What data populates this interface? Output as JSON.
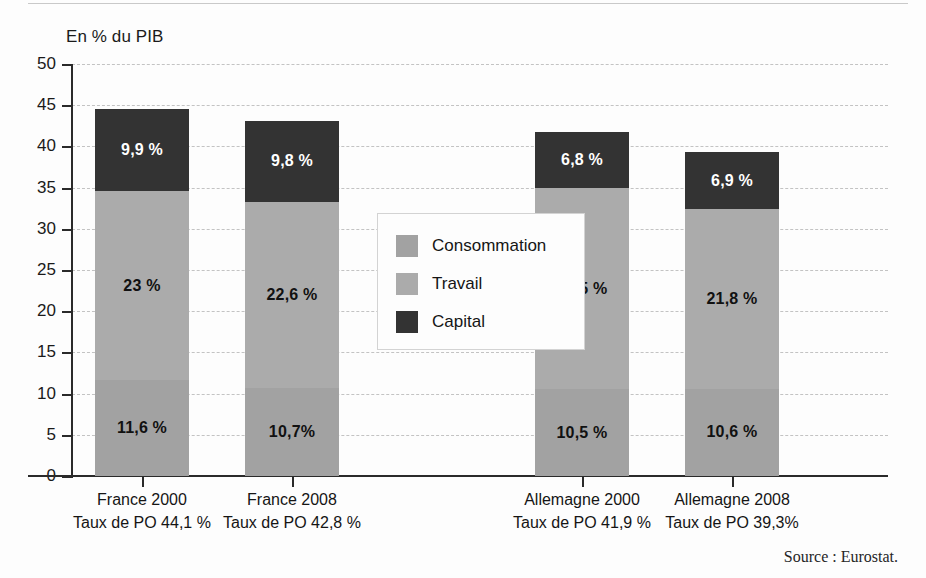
{
  "figure": {
    "axis_title": "En % du PIB",
    "source": "Source : Eurostat."
  },
  "legend": {
    "items": [
      {
        "label": "Consommation",
        "color": "#a2a2a2",
        "key": "consommation"
      },
      {
        "label": "Travail",
        "color": "#ababab",
        "key": "travail"
      },
      {
        "label": "Capital",
        "color": "#333333",
        "key": "capital"
      }
    ]
  },
  "y_axis": {
    "ticks": [
      "0",
      "5",
      "10",
      "15",
      "20",
      "25",
      "30",
      "35",
      "40",
      "45",
      "50"
    ]
  },
  "categories": [
    {
      "line1": "France 2000",
      "line2": "Taux de PO 44,1 %"
    },
    {
      "line1": "France 2008",
      "line2": "Taux de PO 42,8 %"
    },
    {
      "line1": "Allemagne 2000",
      "line2": "Taux de PO 41,9 %"
    },
    {
      "line1": "Allemagne 2008",
      "line2": "Taux de PO 39,3%"
    }
  ],
  "bar_labels": [
    {
      "consommation": "11,6 %",
      "travail": "23 %",
      "capital": "9,9 %"
    },
    {
      "consommation": "10,7%",
      "travail": "22,6 %",
      "capital": "9,8 %"
    },
    {
      "consommation": "10,5 %",
      "travail": "24,5 %",
      "capital": "6,8 %"
    },
    {
      "consommation": "10,6 %",
      "travail": "21,8 %",
      "capital": "6,9 %"
    }
  ],
  "chart_data": {
    "type": "bar",
    "subtype": "stacked-column",
    "title": "",
    "xlabel": "",
    "ylabel": "En % du PIB",
    "ylim": [
      0,
      50
    ],
    "yticks": [
      0,
      5,
      10,
      15,
      20,
      25,
      30,
      35,
      40,
      45,
      50
    ],
    "grid": true,
    "grid_style": "dashed-horizontal",
    "legend_position": "center",
    "categories": [
      "France 2000",
      "France 2008",
      "Allemagne 2000",
      "Allemagne 2008"
    ],
    "category_sublabels": [
      "Taux de PO 44,1 %",
      "Taux de PO 42,8 %",
      "Taux de PO 41,9 %",
      "Taux de PO 39,3%"
    ],
    "series": [
      {
        "name": "Consommation",
        "color": "#a2a2a2",
        "values": [
          11.6,
          10.7,
          10.5,
          10.6
        ]
      },
      {
        "name": "Travail",
        "color": "#ababab",
        "values": [
          23.0,
          22.6,
          24.5,
          21.8
        ]
      },
      {
        "name": "Capital",
        "color": "#333333",
        "values": [
          9.9,
          9.8,
          6.8,
          6.9
        ]
      }
    ],
    "totals": [
      44.5,
      43.1,
      41.8,
      39.3
    ],
    "annotation": "Source : Eurostat."
  },
  "geometry": {
    "bars": [
      {
        "center": 142,
        "width": 94
      },
      {
        "center": 292,
        "width": 94
      },
      {
        "center": 582,
        "width": 94
      },
      {
        "center": 732,
        "width": 94
      }
    ]
  }
}
